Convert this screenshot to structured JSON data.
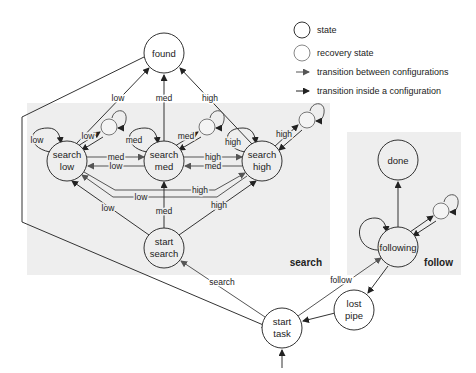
{
  "legend": {
    "state": "state",
    "recovery_state": "recovery state",
    "between": "transition between configurations",
    "inside": "transition inside a configuration"
  },
  "panels": {
    "search": "search",
    "follow": "follow"
  },
  "states": {
    "found": [
      "found"
    ],
    "search_low": [
      "search",
      "low"
    ],
    "search_med": [
      "search",
      "med"
    ],
    "search_high": [
      "search",
      "high"
    ],
    "start_search": [
      "start",
      "search"
    ],
    "start_task": [
      "start",
      "task"
    ],
    "lost_pipe": [
      "lost",
      "pipe"
    ],
    "following": [
      "following"
    ],
    "done": [
      "done"
    ]
  },
  "edge_labels": {
    "low_to_found": "low",
    "med_to_found": "med",
    "high_to_found": "high",
    "low_self": "low",
    "low_recovery": "low",
    "med_self": "med",
    "med_recovery": "med",
    "high_self": "high",
    "high_recovery": "high",
    "low_to_med": "med",
    "med_to_low": "low",
    "med_to_high": "high",
    "high_to_med": "med",
    "low_to_high": "high",
    "high_to_low": "low",
    "start_to_low": "low",
    "start_to_med": "med",
    "start_to_high": "high",
    "task_to_search": "search",
    "task_to_follow": "follow"
  }
}
